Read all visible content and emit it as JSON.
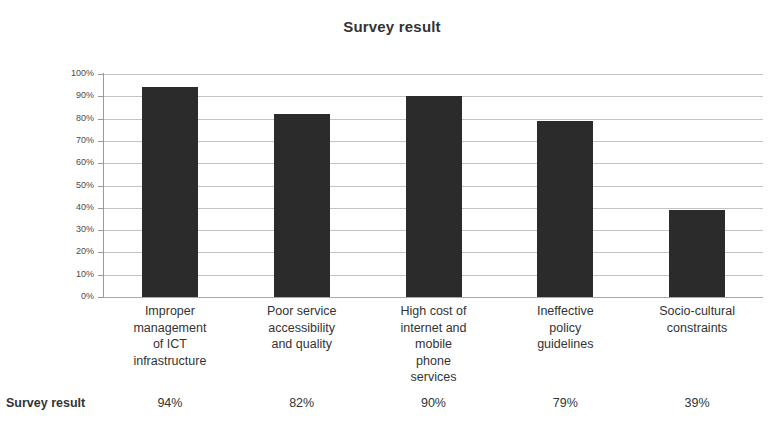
{
  "chart_data": {
    "type": "bar",
    "title": "Survey result",
    "categories": [
      "Improper management of ICT infrastructure",
      "Poor service accessibility and quality",
      "High cost of internet and mobile phone services",
      "Ineffective policy guidelines",
      "Socio-cultural constraints"
    ],
    "category_lines": [
      [
        "Improper",
        "management",
        "of ICT",
        "infrastructure"
      ],
      [
        "Poor service",
        "accessibility",
        "and quality"
      ],
      [
        "High cost of",
        "internet and",
        "mobile",
        "phone",
        "services"
      ],
      [
        "Ineffective",
        "policy",
        "guidelines"
      ],
      [
        "Socio-cultural",
        "constraints"
      ]
    ],
    "series": [
      {
        "name": "Survey result",
        "values": [
          94,
          82,
          90,
          79,
          39
        ],
        "value_labels": [
          "94%",
          "82%",
          "90%",
          "79%",
          "39%"
        ]
      }
    ],
    "xlabel": "",
    "ylabel": "",
    "ylim": [
      0,
      100
    ],
    "y_ticks": [
      0,
      10,
      20,
      30,
      40,
      50,
      60,
      70,
      80,
      90,
      100
    ],
    "y_tick_labels": [
      "0%",
      "10%",
      "20%",
      "30%",
      "40%",
      "50%",
      "60%",
      "70%",
      "80%",
      "90%",
      "100%"
    ],
    "grid": true,
    "legend": "none",
    "bar_color": "#2b2b2b",
    "gridline_color": "#b9b9b9",
    "background_color": "#ffffff"
  },
  "table": {
    "row_label": "Survey result",
    "cells": [
      "94%",
      "82%",
      "90%",
      "79%",
      "39%"
    ]
  }
}
